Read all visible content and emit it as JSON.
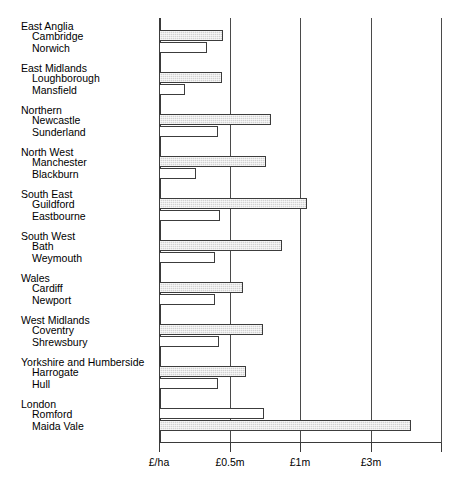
{
  "chart": {
    "title": "",
    "xlabel": "",
    "ylabel": ""
  },
  "axis": {
    "ticks": [
      {
        "label": "£/ha",
        "x": 159
      },
      {
        "label": "£0.5m",
        "x": 230
      },
      {
        "label": "£1m",
        "x": 300
      },
      {
        "label": "£3m",
        "x": 371
      }
    ],
    "end_tick_x": 441
  },
  "chart_data": {
    "type": "bar",
    "orientation": "horizontal",
    "title": "",
    "xlabel": "",
    "ylabel": "",
    "grid": true,
    "legend": "none",
    "axis_tick_labels": [
      "£/ha",
      "£0.5m",
      "£1m",
      "£3m"
    ],
    "axis_tick_pixel_x": [
      159,
      230,
      300,
      371
    ],
    "scale_note": "non-linear (log-like) axis: £/ha origin, then £0.5m, £1m, £3m at even pixel spacing",
    "groups": [
      {
        "name": "East Anglia",
        "bars": [
          {
            "label": "Cambridge",
            "style": "shaded",
            "value_px": 64
          },
          {
            "label": "Norwich",
            "style": "open",
            "value_px": 48
          }
        ]
      },
      {
        "name": "East Midlands",
        "bars": [
          {
            "label": "Loughborough",
            "style": "shaded",
            "value_px": 63
          },
          {
            "label": "Mansfield",
            "style": "open",
            "value_px": 26
          }
        ]
      },
      {
        "name": "Northern",
        "bars": [
          {
            "label": "Newcastle",
            "style": "shaded",
            "value_px": 112
          },
          {
            "label": "Sunderland",
            "style": "open",
            "value_px": 59
          }
        ]
      },
      {
        "name": "North West",
        "bars": [
          {
            "label": "Manchester",
            "style": "shaded",
            "value_px": 107
          },
          {
            "label": "Blackburn",
            "style": "open",
            "value_px": 37
          }
        ]
      },
      {
        "name": "South East",
        "bars": [
          {
            "label": "Guildford",
            "style": "shaded",
            "value_px": 148
          },
          {
            "label": "Eastbourne",
            "style": "open",
            "value_px": 61
          }
        ]
      },
      {
        "name": "South West",
        "bars": [
          {
            "label": "Bath",
            "style": "shaded",
            "value_px": 123
          },
          {
            "label": "Weymouth",
            "style": "open",
            "value_px": 56
          }
        ]
      },
      {
        "name": "Wales",
        "bars": [
          {
            "label": "Cardiff",
            "style": "shaded",
            "value_px": 84
          },
          {
            "label": "Newport",
            "style": "open",
            "value_px": 56
          }
        ]
      },
      {
        "name": "West Midlands",
        "bars": [
          {
            "label": "Coventry",
            "style": "shaded",
            "value_px": 104
          },
          {
            "label": "Shrewsbury",
            "style": "open",
            "value_px": 60
          }
        ]
      },
      {
        "name": "Yorkshire and Humberside",
        "bars": [
          {
            "label": "Harrogate",
            "style": "shaded",
            "value_px": 87
          },
          {
            "label": "Hull",
            "style": "open",
            "value_px": 59
          }
        ]
      },
      {
        "name": "London",
        "bars": [
          {
            "label": "Romford",
            "style": "open",
            "value_px": 105
          },
          {
            "label": "Maida Vale",
            "style": "shaded",
            "value_px": 252
          }
        ]
      }
    ]
  },
  "layout": {
    "plot_left_px": 159,
    "plot_top_px": 18,
    "plot_bottom_px": 443,
    "group_top_px": [
      18,
      60,
      102,
      144,
      186,
      228,
      270,
      312,
      354,
      396
    ],
    "group_label_offset_px": 3,
    "bar1_offset_px": 13,
    "bar2_offset_px": 25,
    "bar_height_px": 11
  },
  "colors": {
    "bar_shaded_fill": "#d2d2d2",
    "bar_stroke": "#3c3c3c",
    "bar_open_fill": "#ffffff",
    "axis": "#3a3a3a",
    "grid": "#4a4a4a",
    "text": "#000000",
    "background": "#ffffff"
  }
}
